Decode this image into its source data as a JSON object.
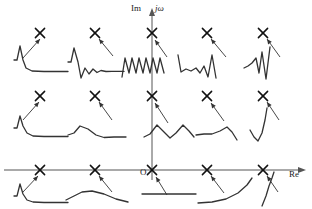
{
  "figure": {
    "background": "#ffffff",
    "stroke": "#333333",
    "axis_stroke": "#555555"
  },
  "axes": {
    "imaginary": {
      "label": "Im",
      "alt_label": "jω",
      "x": 152,
      "y_top": 14,
      "y_bottom": 180,
      "arrow": "up"
    },
    "real": {
      "label": "Re",
      "y": 170,
      "x_left": 4,
      "x_right": 300,
      "arrow": "right"
    },
    "origin": {
      "label": "O",
      "x": 152,
      "y": 170
    }
  },
  "pole_columns": [
    40,
    95,
    152,
    207,
    263
  ],
  "pole_rows": [
    33,
    96,
    170
  ],
  "poles": [
    {
      "id": "p-r1c1",
      "col": 0,
      "row": 0,
      "x": 40,
      "y": 33,
      "marker": "x",
      "region": "left-half-plane",
      "damping": "fast-decay"
    },
    {
      "id": "p-r1c2",
      "col": 1,
      "row": 0,
      "x": 95,
      "y": 33,
      "marker": "x",
      "region": "left-half-plane",
      "damping": "damped-oscillation"
    },
    {
      "id": "p-r1c3",
      "col": 2,
      "row": 0,
      "x": 152,
      "y": 33,
      "marker": "x",
      "region": "imaginary-axis",
      "damping": "sustained-oscillation"
    },
    {
      "id": "p-r1c4",
      "col": 3,
      "row": 0,
      "x": 207,
      "y": 33,
      "marker": "x",
      "region": "right-half-plane",
      "damping": "growing-oscillation"
    },
    {
      "id": "p-r1c5",
      "col": 4,
      "row": 0,
      "x": 263,
      "y": 33,
      "marker": "x",
      "region": "right-half-plane",
      "damping": "fast-growing-oscillation"
    },
    {
      "id": "p-r2c1",
      "col": 0,
      "row": 1,
      "x": 40,
      "y": 96,
      "marker": "x",
      "region": "left-half-plane",
      "damping": "slow-decay"
    },
    {
      "id": "p-r2c2",
      "col": 1,
      "row": 1,
      "x": 95,
      "y": 96,
      "marker": "x",
      "region": "left-half-plane",
      "damping": "slow-damped-oscillation"
    },
    {
      "id": "p-r2c3",
      "col": 2,
      "row": 1,
      "x": 152,
      "y": 96,
      "marker": "x",
      "region": "imaginary-axis",
      "damping": "slow-sustained-oscillation"
    },
    {
      "id": "p-r2c4",
      "col": 3,
      "row": 1,
      "x": 207,
      "y": 96,
      "marker": "x",
      "region": "right-half-plane",
      "damping": "slow-growing-oscillation"
    },
    {
      "id": "p-r2c5",
      "col": 4,
      "row": 1,
      "x": 263,
      "y": 96,
      "marker": "x",
      "region": "right-half-plane",
      "damping": "growing-exponential"
    },
    {
      "id": "p-r3c1",
      "col": 0,
      "row": 2,
      "x": 40,
      "y": 170,
      "marker": "x",
      "region": "negative-real-axis",
      "damping": "fast-exponential-decay"
    },
    {
      "id": "p-r3c2",
      "col": 1,
      "row": 2,
      "x": 95,
      "y": 170,
      "marker": "x",
      "region": "negative-real-axis",
      "damping": "slow-exponential-decay"
    },
    {
      "id": "p-r3c3",
      "col": 2,
      "row": 2,
      "x": 152,
      "y": 170,
      "marker": "x",
      "region": "origin",
      "damping": "constant-step"
    },
    {
      "id": "p-r3c4",
      "col": 3,
      "row": 2,
      "x": 207,
      "y": 170,
      "marker": "x",
      "region": "positive-real-axis",
      "damping": "exponential-growth"
    },
    {
      "id": "p-r3c5",
      "col": 4,
      "row": 2,
      "x": 263,
      "y": 170,
      "marker": "x",
      "region": "positive-real-axis",
      "damping": "fast-exponential-growth"
    }
  ],
  "responses": [
    {
      "id": "w-r1c1",
      "pole": "p-r1c1",
      "name": "fast-decay-response",
      "path": "M 14 60 L 17 60 L 20 46 L 23 60 L 26 68 L 32 71 L 44 71.5 L 68 71.5"
    },
    {
      "id": "w-r1c2",
      "pole": "p-r1c2",
      "name": "damped-oscillation-response",
      "path": "M 68 62 L 71 62 L 74 48 L 78 62 L 81 78 L 85 68 L 89 74 L 93 69 L 97 72.5 L 101 70.5 L 106 71.5 L 112 71.3 L 124 71.4"
    },
    {
      "id": "w-r1c3",
      "pole": "p-r1c3",
      "name": "sustained-oscillation-response",
      "path": "M 122 77 L 125 58 L 129 73 L 132 58 L 136 73 L 139 58 L 143 73 L 146 58 L 150 73 L 153 58 L 157 73 L 160 58 L 164 73"
    },
    {
      "id": "w-r1c4",
      "pole": "p-r1c4",
      "name": "growing-oscillation-response",
      "path": "M 178 55 L 181 72 L 186 69 L 191 71 L 196 68 L 200 73 L 204 66 L 208 77 L 212 55 L 216 78"
    },
    {
      "id": "w-r1c5",
      "pole": "p-r1c5",
      "name": "fast-growing-response",
      "path": "M 244 68 L 248 66 L 252 63 L 256 58 L 259 73 L 262 52 L 266 79 L 270 47"
    },
    {
      "id": "w-r2c1",
      "pole": "p-r2c1",
      "name": "slow-decay-response",
      "path": "M 14 128 L 17 128 L 20 116 L 23 126 L 27 133 L 33 136 L 44 136.5 L 68 136.5"
    },
    {
      "id": "w-r2c2",
      "pole": "p-r2c2",
      "name": "slow-damped-oscillation-response",
      "path": "M 68 135 L 74 133 L 80 126 L 88 129 L 96 135 L 104 137.5 L 114 137 L 126 137"
    },
    {
      "id": "w-r2c3",
      "pole": "p-r2c3",
      "name": "slow-sustained-oscillation-response",
      "path": "M 144 137 L 150 134 L 157 125 L 164 132 L 170 138 L 176 133 L 183 125 L 189 131 L 194 137"
    },
    {
      "id": "w-r2c4",
      "pole": "p-r2c4",
      "name": "slow-growing-oscillation-response",
      "path": "M 196 135 L 204 134 L 212 134 L 220 131 L 227 127 L 232 132 L 237 140"
    },
    {
      "id": "w-r2c5",
      "pole": "p-r2c5",
      "name": "growing-exponential-response",
      "path": "M 250 130 L 254 137 L 258 141 L 262 133 L 265 120 L 267 108"
    },
    {
      "id": "w-r3c1",
      "pole": "p-r3c1",
      "name": "fast-exponential-decay-response",
      "path": "M 14 196 L 17 196 L 20 184 L 23 194 L 27 200 L 33 202 L 44 202.5 L 68 202.5"
    },
    {
      "id": "w-r3c2",
      "pole": "p-r3c2",
      "name": "slow-exponential-decay-response",
      "path": "M 66 200 L 74 196 L 82 192 L 92 191 L 104 194 L 116 199 L 128 202"
    },
    {
      "id": "w-r3c3",
      "pole": "p-r3c3",
      "name": "constant-step-response",
      "path": "M 142 194 L 196 194"
    },
    {
      "id": "w-r3c4",
      "pole": "p-r3c4",
      "name": "exponential-growth-response",
      "path": "M 198 203 L 212 202 L 226 199 L 238 193 L 247 185 L 252 178"
    },
    {
      "id": "w-r3c5",
      "pole": "p-r3c5",
      "name": "fast-exponential-growth-response",
      "path": "M 262 206 L 266 196 L 269 186 L 272 178 L 274 172"
    }
  ],
  "arrows": [
    {
      "id": "a-r1c1",
      "name": "arrow-to-pole-r1c1",
      "x1": 23,
      "y1": 58,
      "x2": 40,
      "y2": 39
    },
    {
      "id": "a-r1c2",
      "name": "arrow-to-pole-r1c2",
      "x1": 113,
      "y1": 56,
      "x2": 99,
      "y2": 39
    },
    {
      "id": "a-r1c3",
      "name": "arrow-to-pole-r1c3",
      "x1": 167,
      "y1": 57,
      "x2": 155,
      "y2": 40
    },
    {
      "id": "a-r1c4",
      "name": "arrow-to-pole-r1c4",
      "x1": 226,
      "y1": 57,
      "x2": 211,
      "y2": 39
    },
    {
      "id": "a-r1c5",
      "name": "arrow-to-pole-r1c5",
      "x1": 280,
      "y1": 57,
      "x2": 267,
      "y2": 39
    },
    {
      "id": "a-r2c1",
      "name": "arrow-to-pole-r2c1",
      "x1": 23,
      "y1": 120,
      "x2": 39,
      "y2": 102
    },
    {
      "id": "a-r2c2",
      "name": "arrow-to-pole-r2c2",
      "x1": 112,
      "y1": 120,
      "x2": 99,
      "y2": 102
    },
    {
      "id": "a-r2c3",
      "name": "arrow-to-pole-r2c3",
      "x1": 168,
      "y1": 123,
      "x2": 155,
      "y2": 103
    },
    {
      "id": "a-r2c4",
      "name": "arrow-to-pole-r2c4",
      "x1": 224,
      "y1": 121,
      "x2": 211,
      "y2": 103
    },
    {
      "id": "a-r2c5",
      "name": "arrow-to-pole-r2c5",
      "x1": 279,
      "y1": 120,
      "x2": 267,
      "y2": 102
    },
    {
      "id": "a-r3c1",
      "name": "arrow-to-pole-r3c1",
      "x1": 23,
      "y1": 192,
      "x2": 38,
      "y2": 176
    },
    {
      "id": "a-r3c2",
      "name": "arrow-to-pole-r3c2",
      "x1": 112,
      "y1": 192,
      "x2": 99,
      "y2": 176
    },
    {
      "id": "a-r3c3",
      "name": "arrow-to-pole-r3c3",
      "x1": 167,
      "y1": 195,
      "x2": 156,
      "y2": 177
    },
    {
      "id": "a-r3c4",
      "name": "arrow-to-pole-r3c4",
      "x1": 224,
      "y1": 193,
      "x2": 211,
      "y2": 176
    },
    {
      "id": "a-r3c5",
      "name": "arrow-to-pole-r3c5",
      "x1": 278,
      "y1": 192,
      "x2": 267,
      "y2": 176
    }
  ]
}
